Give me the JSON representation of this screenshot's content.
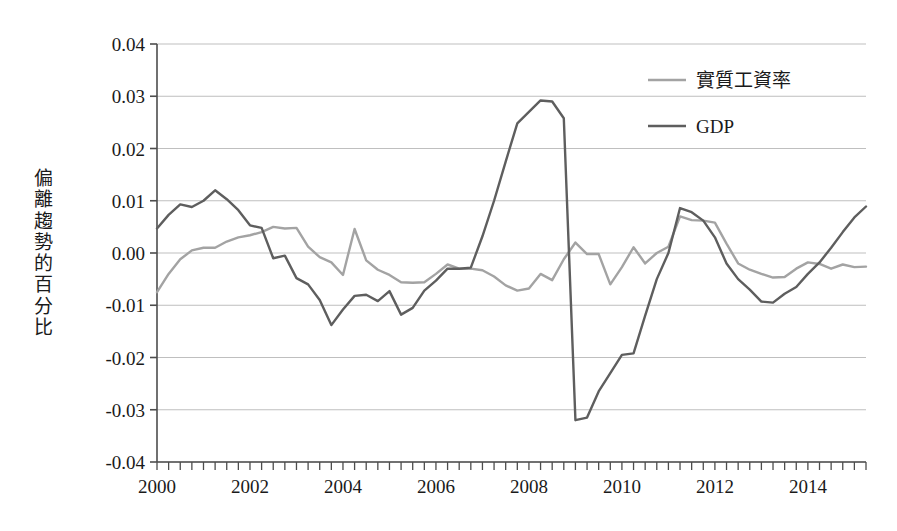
{
  "chart_data": {
    "type": "line",
    "title": "",
    "xlabel": "",
    "ylabel": "偏離趨勢的百分比",
    "ylim": [
      -0.04,
      0.04
    ],
    "xlim": [
      2000.0,
      2015.25
    ],
    "grid": true,
    "legend_position": "top-right",
    "ytick_labels": [
      "0.04",
      "0.03",
      "0.02",
      "0.01",
      "0.00",
      "-0.01",
      "-0.02",
      "-0.03",
      "-0.04"
    ],
    "ytick_values": [
      0.04,
      0.03,
      0.02,
      0.01,
      0.0,
      -0.01,
      -0.02,
      -0.03,
      -0.04
    ],
    "xtick_labels": [
      "2000",
      "2002",
      "2004",
      "2006",
      "2008",
      "2010",
      "2012",
      "2014"
    ],
    "xtick_values": [
      2000,
      2002,
      2004,
      2006,
      2008,
      2010,
      2012,
      2014
    ],
    "minor_tick_interval_years": 0.25,
    "x": [
      2000.0,
      2000.25,
      2000.5,
      2000.75,
      2001.0,
      2001.25,
      2001.5,
      2001.75,
      2002.0,
      2002.25,
      2002.5,
      2002.75,
      2003.0,
      2003.25,
      2003.5,
      2003.75,
      2004.0,
      2004.25,
      2004.5,
      2004.75,
      2005.0,
      2005.25,
      2005.5,
      2005.75,
      2006.0,
      2006.25,
      2006.5,
      2006.75,
      2007.0,
      2007.25,
      2007.5,
      2007.75,
      2008.0,
      2008.25,
      2008.5,
      2008.75,
      2009.0,
      2009.25,
      2009.5,
      2009.75,
      2010.0,
      2010.25,
      2010.5,
      2010.75,
      2011.0,
      2011.25,
      2011.5,
      2011.75,
      2012.0,
      2012.25,
      2012.5,
      2012.75,
      2013.0,
      2013.25,
      2013.5,
      2013.75,
      2014.0,
      2014.25,
      2014.5,
      2014.75,
      2015.0,
      2015.25
    ],
    "series": [
      {
        "name": "實質工資率",
        "color": "#A3A3A3",
        "values": [
          -0.0075,
          -0.004,
          -0.0012,
          0.0005,
          0.001,
          0.001,
          0.0022,
          0.003,
          0.0034,
          0.004,
          0.005,
          0.0047,
          0.0048,
          0.0012,
          -0.0008,
          -0.0018,
          -0.0042,
          0.0046,
          -0.0014,
          -0.0032,
          -0.0042,
          -0.0056,
          -0.0057,
          -0.0056,
          -0.004,
          -0.0022,
          -0.003,
          -0.003,
          -0.0033,
          -0.0045,
          -0.0062,
          -0.0072,
          -0.0068,
          -0.004,
          -0.0052,
          -0.0012,
          0.002,
          -0.0002,
          -0.0002,
          -0.006,
          -0.0027,
          0.0011,
          -0.002,
          0.0,
          0.0012,
          0.007,
          0.0063,
          0.0062,
          0.0058,
          0.0018,
          -0.002,
          -0.0032,
          -0.004,
          -0.0047,
          -0.0046,
          -0.003,
          -0.0018,
          -0.0021,
          -0.003,
          -0.0022,
          -0.0027,
          -0.0026
        ]
      },
      {
        "name": "GDP",
        "color": "#5E5E5E",
        "values": [
          0.0047,
          0.0073,
          0.0093,
          0.0088,
          0.01,
          0.012,
          0.0103,
          0.0082,
          0.0053,
          0.0048,
          -0.001,
          -0.0005,
          -0.0048,
          -0.006,
          -0.009,
          -0.0138,
          -0.0108,
          -0.0082,
          -0.008,
          -0.0092,
          -0.0073,
          -0.0118,
          -0.0105,
          -0.0072,
          -0.0053,
          -0.003,
          -0.003,
          -0.0028,
          0.0032,
          0.01,
          0.0175,
          0.0248,
          0.027,
          0.0292,
          0.029,
          0.0258,
          -0.032,
          -0.0315,
          -0.0265,
          -0.023,
          -0.0195,
          -0.0192,
          -0.012,
          -0.005,
          0.0,
          0.0086,
          0.0078,
          0.0062,
          0.003,
          -0.002,
          -0.005,
          -0.007,
          -0.0093,
          -0.0095,
          -0.0078,
          -0.0065,
          -0.004,
          -0.0018,
          0.001,
          0.004,
          0.0068,
          0.0089
        ]
      }
    ]
  },
  "legend": {
    "items": [
      {
        "label": "實質工資率",
        "color": "#A3A3A3"
      },
      {
        "label": "GDP",
        "color": "#5E5E5E"
      }
    ]
  },
  "axis": {
    "y_title_chars": [
      "偏",
      "離",
      "趨",
      "勢",
      "的",
      "百",
      "分",
      "比"
    ]
  },
  "colors": {
    "gridline": "#BFBFBF",
    "axis": "#4d4d4d",
    "text": "#1a1a1a",
    "background": "#ffffff"
  }
}
